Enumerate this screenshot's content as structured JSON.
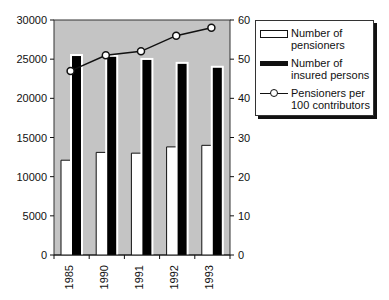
{
  "chart_data": {
    "type": "bar",
    "title": "",
    "xlabel": "",
    "ylabel": "",
    "categories": [
      "1985",
      "1990",
      "1991",
      "1992",
      "1993"
    ],
    "series": [
      {
        "name": "Number of pensioners",
        "type": "bar",
        "axis": "left",
        "color": "#ffffff",
        "values": [
          12100,
          13100,
          13000,
          13800,
          14000
        ]
      },
      {
        "name": "Number of insured persons",
        "type": "bar",
        "axis": "left",
        "color": "#000000",
        "values": [
          25400,
          25300,
          24900,
          24400,
          23900
        ]
      },
      {
        "name": "Pensioners per 100 contributors",
        "type": "line",
        "axis": "right",
        "marker": "open-circle",
        "values": [
          47,
          51,
          52,
          56,
          58
        ]
      }
    ],
    "ylim": [
      0,
      30000
    ],
    "y2lim": [
      0,
      60
    ],
    "yticks": [
      "0",
      "5000",
      "10000",
      "15000",
      "20000",
      "25000",
      "30000"
    ],
    "y2ticks": [
      "0",
      "10",
      "20",
      "30",
      "40",
      "50",
      "60"
    ],
    "grid": false,
    "plot_background": "#c4c4c4",
    "legend_position": "right"
  },
  "legend": {
    "items": [
      {
        "line1": "Number of",
        "line2": "pensioners"
      },
      {
        "line1": "Number of",
        "line2": "insured persons"
      },
      {
        "line1": "Pensioners per",
        "line2": "100 contributors"
      }
    ]
  }
}
